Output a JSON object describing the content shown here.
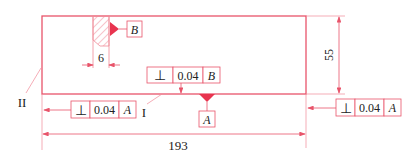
{
  "drawing": {
    "colors": {
      "line": "#e8546a",
      "thin": "#f08a98",
      "text": "#222222",
      "datum_fill": "#e8344f"
    },
    "part_outline": {
      "label": "rectangular plate"
    },
    "dimensions": {
      "length": "193",
      "height": "55",
      "slot_width": "6"
    },
    "datums": {
      "B": "B",
      "A": "A"
    },
    "surface_labels": {
      "roman_one": "I",
      "roman_two": "II"
    },
    "tolerance_frames": [
      {
        "id": "top-center",
        "symbol": "⊥",
        "value": "0.04",
        "datum": "B"
      },
      {
        "id": "bottom-left",
        "symbol": "⊥",
        "value": "0.04",
        "datum": "A"
      },
      {
        "id": "right",
        "symbol": "⊥",
        "value": "0.04",
        "datum": "A"
      }
    ]
  }
}
